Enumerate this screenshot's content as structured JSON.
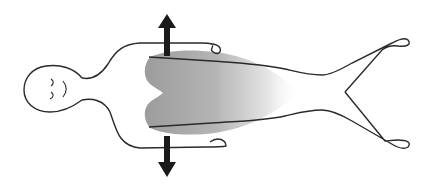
{
  "diagram": {
    "type": "anatomical-illustration",
    "orientation": "head-left, feet-right",
    "elements": {
      "body_outline": {
        "stroke": "#2a2a2a"
      },
      "face": {
        "expression": "eyes-closed"
      },
      "shaded_region": {
        "description": "two-lobed gray shading over chest/abdomen fading toward legs",
        "color_dark": "#9a9a9a",
        "color_light": "#ffffff"
      },
      "inner_lines": {
        "count": 2,
        "stroke": "#2a2a2a"
      },
      "arrows": [
        {
          "direction": "up",
          "color": "#1a1a1a"
        },
        {
          "direction": "down",
          "color": "#1a1a1a"
        }
      ]
    }
  }
}
